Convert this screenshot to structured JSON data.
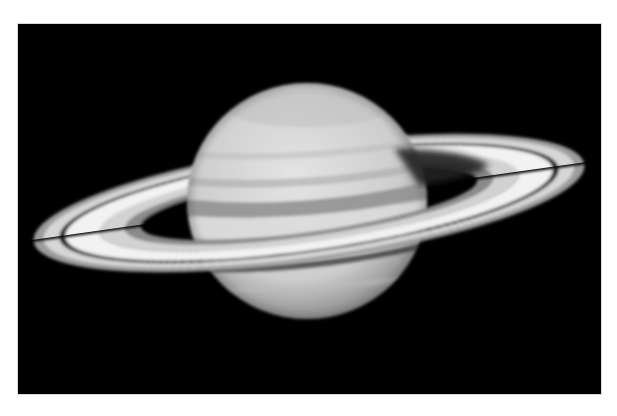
{
  "image": {
    "subject": "Saturn",
    "description": "Grayscale photograph of the planet Saturn with its ring system on a black background",
    "background_color": "#000000",
    "frame_border_color": "#d8d8d8",
    "page_background": "#ffffff"
  },
  "colors": {
    "planet_light": "#e2e2e2",
    "planet_mid": "#c4c4c4",
    "planet_band_dark": "#8e8e8e",
    "ring_bright": "#f4f4f4",
    "ring_mid": "#c8c8c8",
    "ring_outer": "#9a9a9a",
    "cassini_division": "#1a1a1a",
    "ring_shadow": "#262626"
  }
}
